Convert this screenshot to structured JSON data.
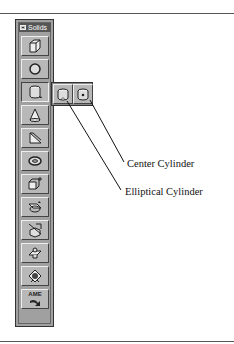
{
  "toolbar": {
    "title": "Solids",
    "buttons": [
      {
        "name": "box",
        "icon": "box-icon"
      },
      {
        "name": "sphere",
        "icon": "sphere-icon"
      },
      {
        "name": "cylinder",
        "icon": "cylinder-icon"
      },
      {
        "name": "cone",
        "icon": "cone-icon"
      },
      {
        "name": "wedge",
        "icon": "wedge-icon"
      },
      {
        "name": "torus",
        "icon": "torus-icon"
      },
      {
        "name": "extrude",
        "icon": "extrude-icon"
      },
      {
        "name": "revolve",
        "icon": "revolve-icon"
      },
      {
        "name": "slice",
        "icon": "slice-icon"
      },
      {
        "name": "section",
        "icon": "section-icon"
      },
      {
        "name": "interfere",
        "icon": "interfere-icon"
      },
      {
        "name": "ame-convert",
        "icon": "ame-icon",
        "text": "AME"
      }
    ]
  },
  "flyout": {
    "buttons": [
      {
        "name": "center-cylinder",
        "icon": "center-cylinder-icon"
      },
      {
        "name": "elliptical-cylinder",
        "icon": "elliptical-cylinder-icon"
      }
    ]
  },
  "callouts": {
    "center": "Center Cylinder",
    "elliptical": "Elliptical Cylinder"
  }
}
